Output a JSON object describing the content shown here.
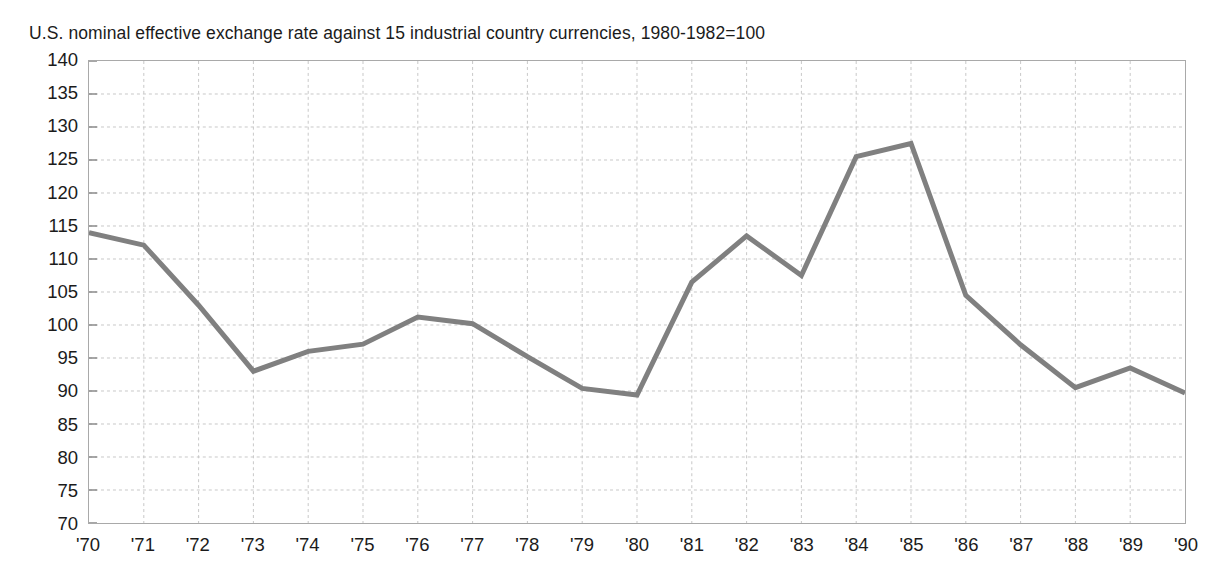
{
  "chart_data": {
    "type": "line",
    "title": "U.S. nominal effective exchange rate against 15 industrial country currencies, 1980-1982=100",
    "xlabel": "",
    "ylabel": "",
    "categories": [
      "'70",
      "'71",
      "'72",
      "'73",
      "'74",
      "'75",
      "'76",
      "'77",
      "'78",
      "'79",
      "'80",
      "'81",
      "'82",
      "'83",
      "'84",
      "'85",
      "'86",
      "'87",
      "'88",
      "'89",
      "'90"
    ],
    "x": [
      1970,
      1971,
      1972,
      1973,
      1974,
      1975,
      1976,
      1977,
      1978,
      1979,
      1980,
      1981,
      1982,
      1983,
      1984,
      1985,
      1986,
      1987,
      1988,
      1989,
      1990
    ],
    "values": [
      114.0,
      112.1,
      103.0,
      93.0,
      96.0,
      97.1,
      101.2,
      100.2,
      95.2,
      90.4,
      89.4,
      106.5,
      113.5,
      107.5,
      125.5,
      127.5,
      104.5,
      97.0,
      90.5,
      93.5,
      89.7
    ],
    "series": [
      {
        "name": "U.S. nominal effective exchange rate",
        "values": [
          114.0,
          112.1,
          103.0,
          93.0,
          96.0,
          97.1,
          101.2,
          100.2,
          95.2,
          90.4,
          89.4,
          106.5,
          113.5,
          107.5,
          125.5,
          127.5,
          104.5,
          97.0,
          90.5,
          93.5,
          89.7
        ],
        "color": "#808080"
      }
    ],
    "ylim": [
      70,
      140
    ],
    "yticks": [
      140,
      135,
      130,
      125,
      120,
      115,
      110,
      105,
      100,
      95,
      90,
      85,
      80,
      75,
      70
    ],
    "ytick_labels": [
      "140",
      "135",
      "130",
      "125",
      "120",
      "115",
      "110",
      "105",
      "100",
      "95",
      "90",
      "85",
      "80",
      "75",
      "70"
    ],
    "grid": true,
    "grid_style": "dashed",
    "grid_color": "#c8c8c8",
    "legend": false,
    "legend_position": "none",
    "line_color": "#808080",
    "line_width": 5,
    "border_color": "#a9a9a9",
    "background_color": "#ffffff"
  }
}
